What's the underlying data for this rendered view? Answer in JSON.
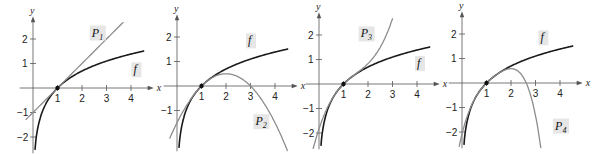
{
  "chart_data": [
    {
      "type": "line",
      "title": "",
      "xlabel": "x",
      "ylabel": "y",
      "xlim": [
        -0.3,
        4.6
      ],
      "ylim": [
        -2.5,
        2.6
      ],
      "x_ticks": [
        "1",
        "2",
        "3",
        "4"
      ],
      "y_ticks": [
        "2",
        "1",
        "-1",
        "-2"
      ],
      "series": [
        {
          "name": "f",
          "expr": "ln(x)"
        },
        {
          "name": "P1",
          "expr": "(x-1)"
        }
      ],
      "annotations": [
        {
          "text": "f",
          "at": [
            4.1,
            0.6
          ]
        },
        {
          "text": "P",
          "sub": "1",
          "at": [
            2.4,
            2.1
          ]
        }
      ],
      "point": [
        1,
        0
      ]
    },
    {
      "type": "line",
      "xlabel": "x",
      "ylabel": "y",
      "xlim": [
        -0.3,
        4.6
      ],
      "ylim": [
        -2.5,
        2.6
      ],
      "x_ticks": [
        "1",
        "2",
        "3",
        "4"
      ],
      "y_ticks": [
        "2",
        "1",
        "-1"
      ],
      "series": [
        {
          "name": "f",
          "expr": "ln(x)"
        },
        {
          "name": "P2",
          "expr": "(x-1)-(x-1)^2/2"
        }
      ],
      "annotations": [
        {
          "text": "f",
          "at": [
            2.9,
            1.7
          ]
        },
        {
          "text": "P",
          "sub": "2",
          "at": [
            3.2,
            -1.6
          ]
        }
      ],
      "point": [
        1,
        0
      ]
    },
    {
      "type": "line",
      "xlabel": "x",
      "ylabel": "y",
      "xlim": [
        -0.3,
        4.6
      ],
      "ylim": [
        -2.5,
        2.6
      ],
      "x_ticks": [
        "1",
        "2",
        "3",
        "4"
      ],
      "y_ticks": [
        "2",
        "1",
        "-1",
        "-2"
      ],
      "series": [
        {
          "name": "f",
          "expr": "ln(x)"
        },
        {
          "name": "P3",
          "expr": "(x-1)-(x-1)^2/2+(x-1)^3/3"
        }
      ],
      "annotations": [
        {
          "text": "f",
          "at": [
            4.0,
            0.7
          ]
        },
        {
          "text": "P",
          "sub": "3",
          "at": [
            1.7,
            1.9
          ]
        }
      ],
      "point": [
        1,
        0
      ]
    },
    {
      "type": "line",
      "xlabel": "x",
      "ylabel": "y",
      "xlim": [
        -0.3,
        4.6
      ],
      "ylim": [
        -2.5,
        2.6
      ],
      "x_ticks": [
        "1",
        "2",
        "3",
        "4"
      ],
      "y_ticks": [
        "2",
        "1",
        "-1",
        "-2"
      ],
      "series": [
        {
          "name": "f",
          "expr": "ln(x)"
        },
        {
          "name": "P4",
          "expr": "(x-1)-(x-1)^2/2+(x-1)^3/3-(x-1)^4/4"
        }
      ],
      "annotations": [
        {
          "text": "f",
          "at": [
            3.2,
            1.7
          ]
        },
        {
          "text": "P",
          "sub": "4",
          "at": [
            3.8,
            -1.9
          ]
        }
      ],
      "point": [
        1,
        0
      ]
    }
  ],
  "panels": [
    {
      "ox": 33,
      "oy": 88,
      "u": 24.5,
      "ylabel_x": "y",
      "xlabel": "x"
    },
    {
      "ox": 177,
      "oy": 86,
      "u": 24.5,
      "ylabel_x": "y",
      "xlabel": "x"
    },
    {
      "ox": 319,
      "oy": 84,
      "u": 24.5,
      "ylabel_x": "y",
      "xlabel": "x"
    },
    {
      "ox": 462,
      "oy": 83,
      "u": 24.5,
      "ylabel_x": "y",
      "xlabel": "x"
    }
  ],
  "colors": {
    "f": "#1a1a1a",
    "poly": "#8c8c8c",
    "axis": "#555555",
    "label_bg": "#e6e6e6"
  }
}
